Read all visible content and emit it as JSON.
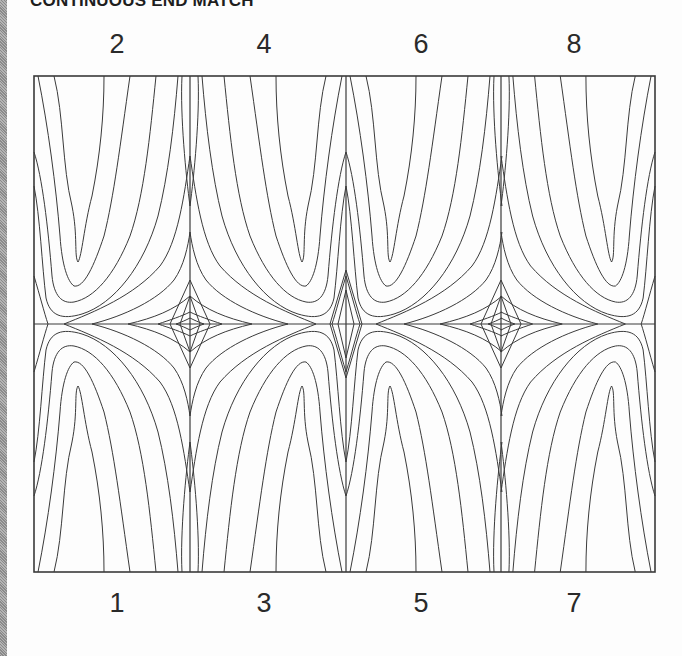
{
  "title": "CONTINUOUS END MATCH",
  "layout": {
    "columns": 4,
    "rows": 2,
    "frame": {
      "x": 34,
      "y": 76,
      "width": 621,
      "height": 496
    },
    "column_dividers_x": [
      190,
      346,
      501
    ],
    "row_divider_y": 324
  },
  "top_labels": [
    {
      "text": "2",
      "x": 117
    },
    {
      "text": "4",
      "x": 264
    },
    {
      "text": "6",
      "x": 421
    },
    {
      "text": "8",
      "x": 574
    }
  ],
  "bottom_labels": [
    {
      "text": "1",
      "x": 117
    },
    {
      "text": "3",
      "x": 264
    },
    {
      "text": "5",
      "x": 421
    },
    {
      "text": "7",
      "x": 574
    }
  ],
  "panels": [
    {
      "number": "2",
      "position": "top",
      "column": 1,
      "grain": "cathedral-up",
      "apex": "left"
    },
    {
      "number": "4",
      "position": "top",
      "column": 2,
      "grain": "cathedral-up",
      "apex": "right"
    },
    {
      "number": "6",
      "position": "top",
      "column": 3,
      "grain": "cathedral-up",
      "apex": "left"
    },
    {
      "number": "8",
      "position": "top",
      "column": 4,
      "grain": "cathedral-up",
      "apex": "right"
    },
    {
      "number": "1",
      "position": "bottom",
      "column": 1,
      "grain": "cathedral-down",
      "apex": "left"
    },
    {
      "number": "3",
      "position": "bottom",
      "column": 2,
      "grain": "cathedral-down",
      "apex": "right"
    },
    {
      "number": "5",
      "position": "bottom",
      "column": 3,
      "grain": "cathedral-down",
      "apex": "left"
    },
    {
      "number": "7",
      "position": "bottom",
      "column": 4,
      "grain": "cathedral-down",
      "apex": "right"
    }
  ],
  "colors": {
    "line": "#3a3a3a",
    "background": "#fdfdfd"
  }
}
